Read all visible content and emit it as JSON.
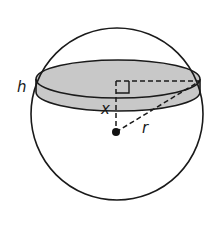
{
  "diagram": {
    "type": "geometry",
    "colors": {
      "stroke": "#1a1a1a",
      "disk_fill": "#c8c8c8",
      "background": "#ffffff"
    },
    "labels": {
      "thickness": "h",
      "distance": "x",
      "radius": "r"
    },
    "elements": [
      {
        "name": "sphere-outline",
        "shape": "circle"
      },
      {
        "name": "disk-slice",
        "shape": "cylinder",
        "label": "h"
      },
      {
        "name": "center-point",
        "shape": "dot"
      },
      {
        "name": "distance-segment",
        "style": "dashed",
        "label": "x"
      },
      {
        "name": "slice-radius-segment",
        "style": "dashed"
      },
      {
        "name": "sphere-radius-segment",
        "style": "dashed",
        "label": "r"
      },
      {
        "name": "right-angle-marker",
        "shape": "square-corner"
      }
    ]
  }
}
